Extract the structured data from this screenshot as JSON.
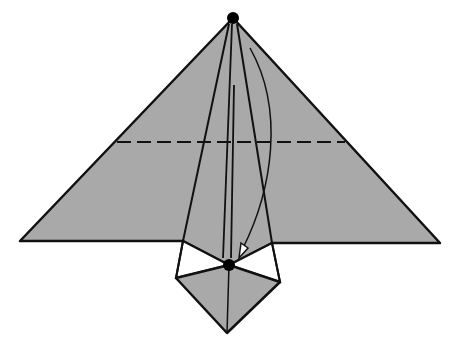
{
  "diagram": {
    "type": "origami-fold-step",
    "description": "Origami triangle fold step: fold the top point down to the lower dot along the dashed valley line",
    "colors": {
      "paper": "#a9a9a9",
      "line": "#111111",
      "background": "#ffffff",
      "dot": "#000000"
    },
    "points": {
      "top_dot": [
        233,
        18
      ],
      "lower_dot": [
        229,
        265
      ]
    },
    "fold_line": {
      "style": "dashed",
      "y": 142,
      "x1": 117,
      "x2": 345
    },
    "arrow": {
      "from": [
        250,
        48
      ],
      "to": [
        240,
        256
      ],
      "direction": "down"
    }
  }
}
